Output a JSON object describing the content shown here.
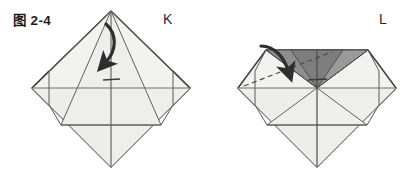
{
  "figure": {
    "number_label": "图 2-4",
    "panels": [
      {
        "id": "K",
        "label": "K"
      },
      {
        "id": "L",
        "label": "L"
      }
    ]
  },
  "colors": {
    "background": "#ffffff",
    "paper_light": "#f2f2f0",
    "paper_mid": "#ebebe9",
    "paper_shadow": "#e4e4e2",
    "paper_dark": "#8e8e8e",
    "paper_dark2": "#9a9a9a",
    "outline": "#3a3a3a",
    "crease": "#6f6f6f",
    "arrow": "#2e2e2e",
    "dashed": "#4a4a4a",
    "text": "#1d1d1d"
  },
  "panel_k": {
    "name": "K",
    "shape": "diamond",
    "vertices": {
      "top": [
        111,
        11
      ],
      "right": [
        190,
        88
      ],
      "bottom": [
        111,
        167
      ],
      "left": [
        32,
        88
      ]
    },
    "creases": [
      "vertical-center",
      "horizontal-center",
      "diagonal-left-flap",
      "diagonal-right-flap",
      "inner-triangle-left",
      "inner-triangle-right"
    ],
    "arrow": {
      "type": "curved-fold-arrow",
      "direction": "down-left",
      "style": "solid"
    },
    "tick_mark": {
      "type": "short-horizontal-crease",
      "position": [
        104,
        80
      ],
      "length": 16
    }
  },
  "panel_l": {
    "name": "L",
    "shape": "diamond-with-folded-top",
    "vertices": {
      "top_left": [
        266,
        50
      ],
      "top_right": [
        368,
        50
      ],
      "right": [
        396,
        88
      ],
      "bottom": [
        317,
        167
      ],
      "left": [
        238,
        88
      ]
    },
    "shaded_region": {
      "name": "folded-flap",
      "fill": "#8e8e8e",
      "description": "dark gray folded triangle at top"
    },
    "creases": [
      "vertical-center",
      "horizontal-center",
      "diagonal-left-flap",
      "diagonal-right-flap",
      "inner-triangle-left",
      "inner-triangle-right"
    ],
    "dashed_line": {
      "type": "valley-fold-guide",
      "from": [
        246,
        84
      ],
      "to": [
        330,
        52
      ]
    },
    "arrow": {
      "type": "curved-fold-arrow",
      "direction": "down-right",
      "style": "solid"
    },
    "tick_mark": {
      "type": "short-horizontal-crease",
      "position": [
        310,
        78
      ],
      "length": 16
    }
  }
}
